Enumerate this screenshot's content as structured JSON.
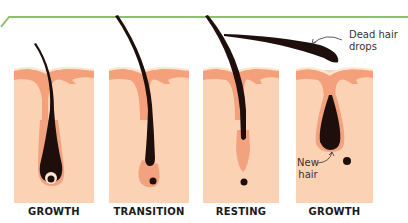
{
  "diagram": {
    "colors": {
      "frame_line": "#8cc06a",
      "skin": "#fbd3b4",
      "skin_top": "#f4a07a",
      "skin_surface": "#fde6cf",
      "hair": "#1e0f0c",
      "follicle": "#f2a27e"
    },
    "stages": [
      {
        "label": "GROWTH"
      },
      {
        "label": "TRANSITION"
      },
      {
        "label": "RESTING"
      },
      {
        "label": "GROWTH"
      }
    ],
    "annotations": {
      "dead_hair_line1": "Dead hair",
      "dead_hair_line2": "drops",
      "new_hair_line1": "New",
      "new_hair_line2": "hair"
    }
  }
}
